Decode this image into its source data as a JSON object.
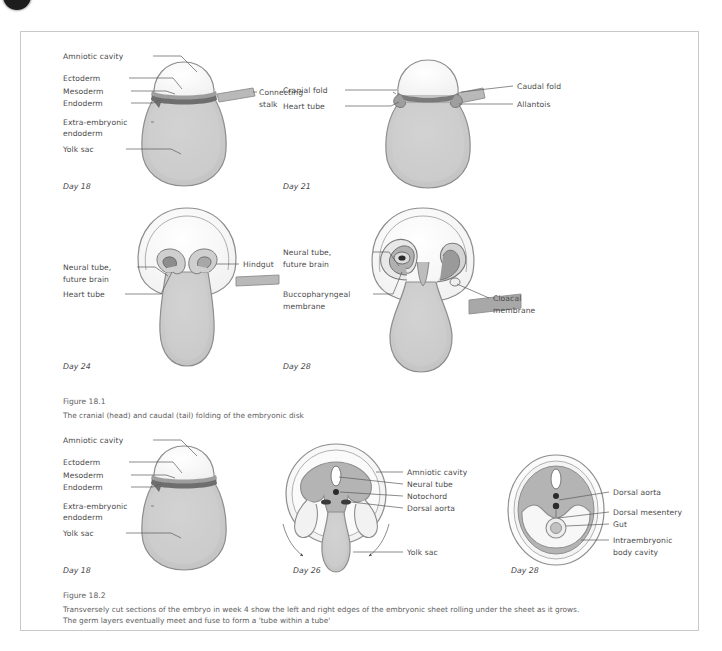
{
  "page": {
    "background_color": "#ffffff",
    "border_color": "#c9c9c9",
    "corner_mark": "bullet-mark"
  },
  "palette": {
    "amnion_fill": "#fbfbfb",
    "amnion_light": "#f4f4f4",
    "yolk_fill": "#c9c9c9",
    "yolk_light": "#dcdcdc",
    "mesoderm_dark": "#6e6e6e",
    "ectoderm_mid": "#9e9e9e",
    "outline": "#8d8d8d",
    "text": "#4a4a4a",
    "caption_text": "#606060",
    "stalk_fill": "#b9b9b9",
    "notochord": "#2b2b2b"
  },
  "figures": [
    {
      "id": "figure-18-1",
      "caption_title": "Figure 18.1",
      "caption_lines": [
        "The cranial (head) and caudal (tail) folding of the embryonic disk"
      ],
      "panels": [
        {
          "id": "panel-day18-sagittal",
          "day_label": "Day 18",
          "labels": [
            "Amniotic cavity",
            "Ectoderm",
            "Mesoderm",
            "Endoderm",
            "Extra-embryonic",
            "endoderm",
            "Yolk sac",
            "Connecting",
            "stalk"
          ]
        },
        {
          "id": "panel-day21-sagittal",
          "day_label": "Day 21",
          "labels": [
            "Cranial fold",
            "Heart tube",
            "Caudal fold",
            "Allantois"
          ]
        },
        {
          "id": "panel-day24-sagittal",
          "day_label": "Day 24",
          "labels": [
            "Neural tube,",
            "future brain",
            "Heart tube",
            "Hindgut"
          ]
        },
        {
          "id": "panel-day28-sagittal",
          "day_label": "Day 28",
          "labels": [
            "Neural tube,",
            "future brain",
            "Buccopharyngeal",
            "membrane",
            "Cloacal",
            "membrane"
          ]
        }
      ]
    },
    {
      "id": "figure-18-2",
      "caption_title": "Figure 18.2",
      "caption_lines": [
        "Transversely cut sections of the embryo in week 4 show the left and right edges of the embryonic sheet rolling under the sheet as it grows.",
        "The germ layers eventually meet and fuse to form a 'tube within a tube'"
      ],
      "panels": [
        {
          "id": "panel-day18-transverse",
          "day_label": "Day 18",
          "labels": [
            "Amniotic cavity",
            "Ectoderm",
            "Mesoderm",
            "Endoderm",
            "Extra-embryonic",
            "endoderm",
            "Yolk sac"
          ]
        },
        {
          "id": "panel-day26-transverse",
          "day_label": "Day 26",
          "labels": [
            "Amniotic cavity",
            "Neural tube",
            "Notochord",
            "Dorsal aorta",
            "Yolk sac"
          ]
        },
        {
          "id": "panel-day28-transverse",
          "day_label": "Day 28",
          "labels": [
            "Dorsal aorta",
            "Dorsal mesentery",
            "Gut",
            "Intraembryonic",
            "body cavity"
          ]
        }
      ]
    }
  ],
  "text": {
    "amniotic_cavity": "Amniotic cavity",
    "ectoderm": "Ectoderm",
    "mesoderm": "Mesoderm",
    "endoderm": "Endoderm",
    "extra_embryonic": "Extra-embryonic",
    "endoderm2": "endoderm",
    "yolk_sac": "Yolk sac",
    "connecting": "Connecting",
    "stalk": "stalk",
    "day18": "Day 18",
    "cranial_fold": "Cranial fold",
    "heart_tube": "Heart tube",
    "caudal_fold": "Caudal fold",
    "allantois": "Allantois",
    "day21": "Day 21",
    "neural_tube_line1": "Neural tube,",
    "neural_tube_line2": "future brain",
    "hindgut": "Hindgut",
    "day24": "Day 24",
    "buccopharyngeal": "Buccopharyngeal",
    "membrane": "membrane",
    "cloacal": "Cloacal",
    "membrane2": "membrane",
    "day28": "Day 28",
    "fig181_title": "Figure 18.1",
    "fig181_line1": "The cranial (head) and caudal (tail) folding of the embryonic disk",
    "neural_tube": "Neural tube",
    "notochord": "Notochord",
    "dorsal_aorta": "Dorsal aorta",
    "day26": "Day 26",
    "dorsal_mesentery": "Dorsal mesentery",
    "gut": "Gut",
    "intraembryonic": "Intraembryonic",
    "body_cavity": "body cavity",
    "fig182_title": "Figure 18.2",
    "fig182_line1": "Transversely cut sections of the embryo in week 4 show the left and right edges of the embryonic sheet rolling under the sheet as it grows.",
    "fig182_line2": "The germ layers eventually meet and fuse to form a 'tube within a tube'"
  }
}
